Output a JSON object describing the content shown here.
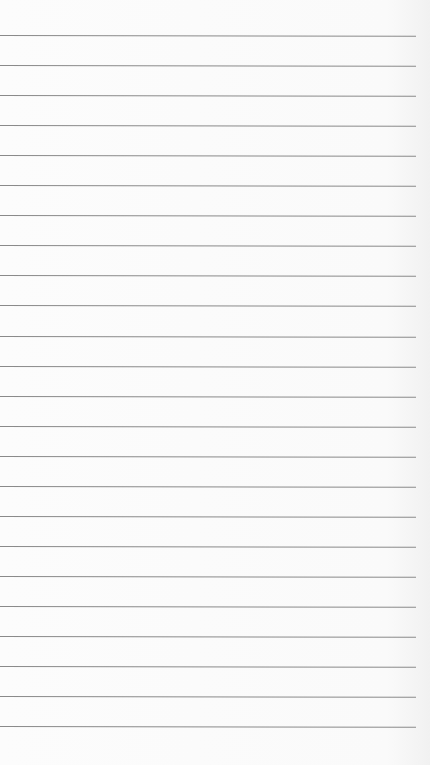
{
  "paper": {
    "background_color": "#fbfbfb",
    "line_color": "#8a8a8a",
    "line_count": 24,
    "first_line_y": 35,
    "line_spacing": 30.05,
    "line_length": 416
  }
}
